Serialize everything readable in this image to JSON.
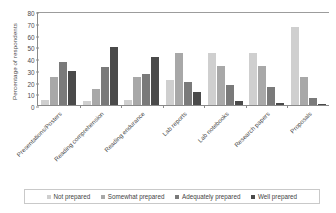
{
  "chart_data": {
    "type": "bar",
    "title": "",
    "xlabel": "",
    "ylabel": "Percentage of respondents",
    "ylim": [
      0,
      80
    ],
    "yticks": [
      0,
      10,
      20,
      30,
      40,
      50,
      60,
      70,
      80
    ],
    "grid": false,
    "legend_position": "bottom",
    "categories": [
      "Presentations/Posters",
      "Reading comprehension",
      "Reading endurance",
      "Lab reports",
      "Lab notebooks",
      "Research papers",
      "Proposals"
    ],
    "series": [
      {
        "name": "Not prepared",
        "color": "#cfcfcf",
        "values": [
          4,
          3,
          4,
          21,
          44,
          44,
          66
        ]
      },
      {
        "name": "Somewhat prepared",
        "color": "#a8a8a8",
        "values": [
          24,
          14,
          24,
          44,
          33,
          33,
          24
        ]
      },
      {
        "name": "Adequately prepared",
        "color": "#7a7a7a",
        "values": [
          37,
          32,
          26,
          20,
          17,
          15,
          6
        ]
      },
      {
        "name": "Well prepared",
        "color": "#4a4a4a",
        "values": [
          29,
          49,
          41,
          11,
          3,
          2,
          1
        ]
      }
    ]
  },
  "legend": {
    "items": [
      {
        "label": "Not prepared"
      },
      {
        "label": "Somewhat prepared"
      },
      {
        "label": "Adequately prepared"
      },
      {
        "label": "Well prepared"
      }
    ]
  }
}
